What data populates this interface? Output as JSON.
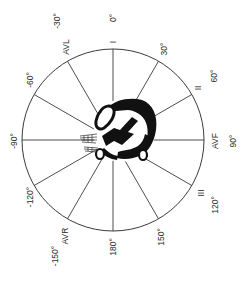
{
  "diagram": {
    "center": {
      "x": 113,
      "y": 140
    },
    "radius": 91,
    "line_color": "#3a3a3a",
    "heart_color": "#111111",
    "leads": [
      {
        "name": "I",
        "angle": 0
      },
      {
        "name": "II",
        "angle": 60
      },
      {
        "name": "AVF",
        "angle": 90
      },
      {
        "name": "III",
        "angle": 120
      },
      {
        "name": "AVR",
        "angle": -150
      },
      {
        "name": "AVL",
        "angle": -30
      }
    ],
    "degree_labels": [
      "0°",
      "30°",
      "60°",
      "90°",
      "120°",
      "150°",
      "180°",
      "-150°",
      "-120°",
      "-90°",
      "-60°",
      "-30°"
    ],
    "lead_labels": {
      "I": "I",
      "II": "II",
      "AVF": "AVF",
      "III": "III",
      "AVR": "AVR",
      "AVL": "AVL"
    },
    "degrees": {
      "d0": "0°",
      "d30": "30°",
      "d60": "60°",
      "d90": "90°",
      "d120": "120°",
      "d150": "150°",
      "d180": "180°",
      "dm150": "-150°",
      "dm120": "-120°",
      "dm90": "-90°",
      "dm60": "-60°",
      "dm30": "-30°"
    }
  }
}
